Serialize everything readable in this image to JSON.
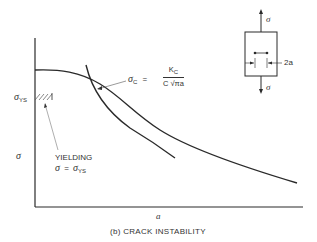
{
  "figure": {
    "caption": "(b) CRACK INSTABILITY",
    "x_axis_label": "a",
    "y_axis_label": "σ",
    "y_tick_label": "σ",
    "y_tick_subscript": "YS",
    "curves": [
      {
        "name": "crack instability curve",
        "equation_lhs": "σ",
        "equation_lhs_sub": "C",
        "equation_eq": "=",
        "numerator": "K",
        "numerator_sub": "C",
        "denominator": "C √πa"
      },
      {
        "name": "yielding curve",
        "label_line1": "YIELDING",
        "label_line2_lhs": "σ",
        "label_line2_eq": "=",
        "label_line2_rhs": "σ",
        "label_line2_rhs_sub": "YS"
      }
    ],
    "specimen": {
      "load_top": "σ",
      "load_bottom": "σ",
      "crack_label": "2a"
    }
  },
  "colors": {
    "line": "#2a2a2a",
    "background": "#ffffff"
  }
}
